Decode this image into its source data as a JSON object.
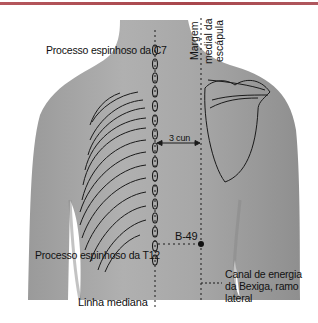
{
  "figure": {
    "title_bar_color": "#a8464c",
    "labels": {
      "c7": "Processo espinhoso da C7",
      "scapula_line1": "Margem",
      "scapula_line2": "medial da",
      "scapula_line3": "escápula",
      "distance": "3 cun",
      "point": "B-49",
      "t12": "Processo espinhoso da T12",
      "channel_line1": "Canal de energia",
      "channel_line2": "da Bexiga, ramo",
      "channel_line3": "lateral",
      "midline": "Linha mediana"
    },
    "colors": {
      "skin": "#a9a9a9",
      "skin_shadow": "#8e8e8e",
      "line": "#1a1a1a",
      "background": "#ffffff"
    }
  }
}
